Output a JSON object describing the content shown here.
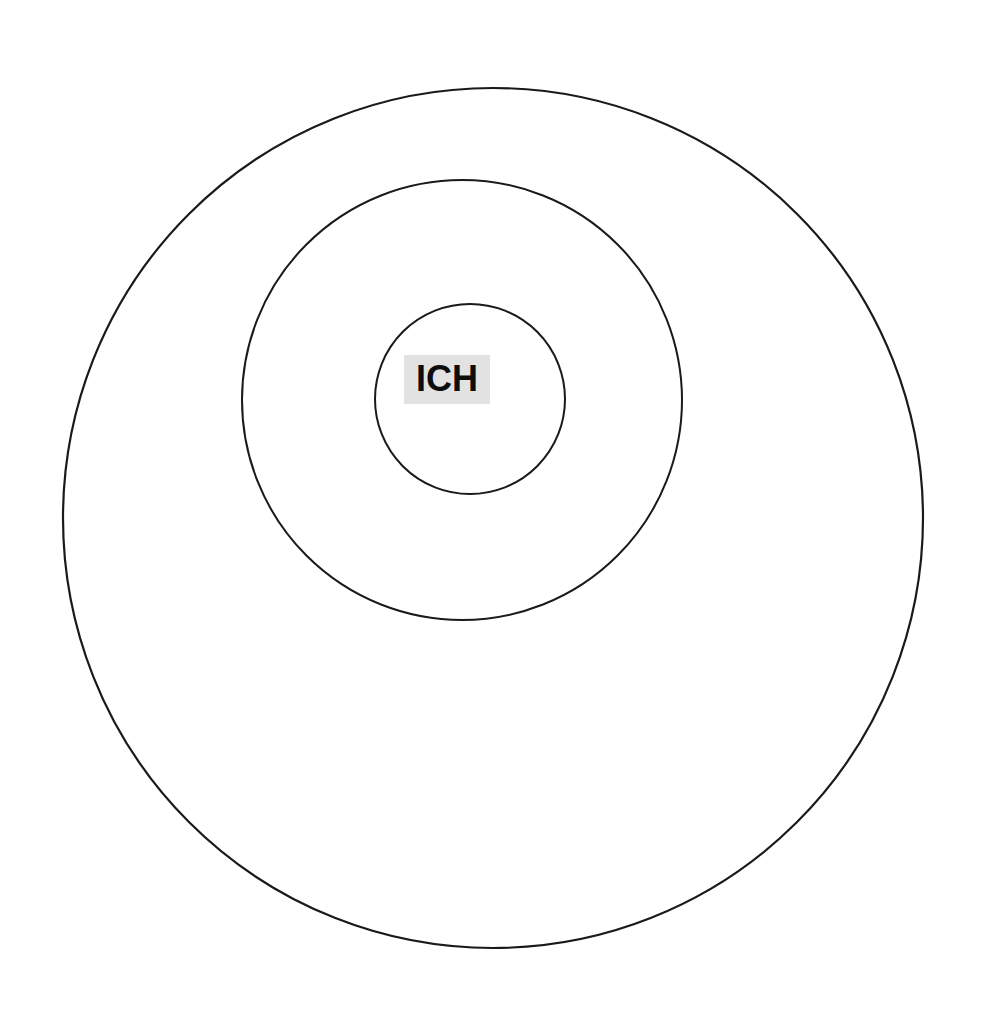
{
  "canvas": {
    "width": 987,
    "height": 1024,
    "background_color": "#ffffff"
  },
  "diagram": {
    "type": "concentric-circles",
    "title": "",
    "stroke_color": "#1a1a1a",
    "fill_color": "none",
    "stroke_width": 2,
    "rings": [
      {
        "name": "outer-ring",
        "label": "",
        "cx": 493,
        "cy": 518,
        "r": 430,
        "stroke_width": 2.2
      },
      {
        "name": "middle-ring",
        "label": "",
        "cx": 462,
        "cy": 400,
        "r": 220,
        "stroke_width": 2.0
      },
      {
        "name": "inner-ring",
        "label": "",
        "cx": 470,
        "cy": 399,
        "r": 95,
        "stroke_width": 2.0
      }
    ]
  },
  "labels": {
    "center": {
      "text": "ICH",
      "highlight_color": "#e2e2e2",
      "text_color": "#0d0d0d",
      "x": 404,
      "y": 355,
      "width": 86,
      "height": 49
    }
  },
  "chart_data": {
    "type": "diagram",
    "title": "",
    "subtitle": "",
    "xlabel": "",
    "ylabel": "",
    "legend": [],
    "annotations": [
      "ICH"
    ],
    "categories": [
      "inner-ring",
      "middle-ring",
      "outer-ring"
    ],
    "values": [
      95,
      220,
      430
    ],
    "series": [
      {
        "name": "radius_px",
        "values": [
          95,
          220,
          430
        ]
      }
    ]
  }
}
